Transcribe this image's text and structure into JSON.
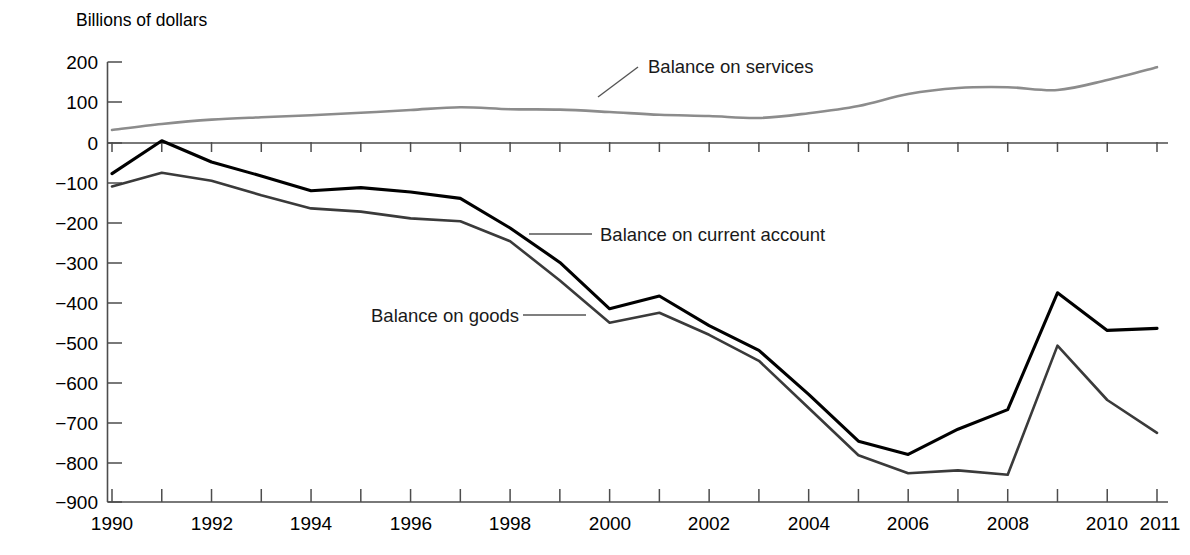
{
  "chart_data": {
    "type": "line",
    "title": "",
    "ylabel": "Billions of dollars",
    "xlabel": "",
    "ylim": [
      -900,
      200
    ],
    "xlim": [
      1990,
      2011
    ],
    "grid": false,
    "legend_position": "inline-annotations",
    "y_ticks": [
      200,
      100,
      0,
      -100,
      -200,
      -300,
      -400,
      -500,
      -600,
      -700,
      -800,
      -900
    ],
    "y_tick_labels": [
      "200",
      "100",
      "0",
      "−100",
      "−200",
      "−300",
      "−400",
      "−500",
      "−600",
      "−700",
      "−800",
      "−900"
    ],
    "x_ticks": [
      1990,
      1991,
      1992,
      1993,
      1994,
      1995,
      1996,
      1997,
      1998,
      1999,
      2000,
      2001,
      2002,
      2003,
      2004,
      2005,
      2006,
      2007,
      2008,
      2009,
      2010,
      2011
    ],
    "x_tick_labels_shown": [
      "1990",
      "1992",
      "1994",
      "1996",
      "1998",
      "2000",
      "2002",
      "2004",
      "2006",
      "2008",
      "2010",
      "2011"
    ],
    "x": [
      1990,
      1991,
      1992,
      1993,
      1994,
      1995,
      1996,
      1997,
      1998,
      1999,
      2000,
      2001,
      2002,
      2003,
      2004,
      2005,
      2006,
      2007,
      2008,
      2009,
      2010,
      2011
    ],
    "series": [
      {
        "name": "Balance on services",
        "color": "#8c8c8c",
        "values": [
          30,
          45,
          56,
          62,
          67,
          73,
          80,
          87,
          82,
          81,
          75,
          68,
          65,
          60,
          72,
          90,
          120,
          135,
          137,
          130,
          155,
          187
        ]
      },
      {
        "name": "Balance on current account",
        "color": "#000000",
        "values": [
          -79,
          3,
          -50,
          -85,
          -122,
          -114,
          -125,
          -141,
          -215,
          -301,
          -417,
          -385,
          -459,
          -521,
          -631,
          -748,
          -781,
          -718,
          -669,
          -377,
          -471,
          -466
        ]
      },
      {
        "name": "Balance on goods",
        "color": "#3a3a3a",
        "values": [
          -111,
          -77,
          -97,
          -133,
          -166,
          -174,
          -191,
          -198,
          -248,
          -346,
          -452,
          -427,
          -482,
          -547,
          -665,
          -783,
          -828,
          -821,
          -832,
          -509,
          -645,
          -727
        ]
      }
    ],
    "annotations": [
      {
        "label": "Balance on services",
        "target_year": 2001,
        "target_value": 68,
        "leader_style": "diagonal"
      },
      {
        "label": "Balance on current account",
        "target_year": 1999,
        "target_value": -301,
        "leader_style": "horizontal"
      },
      {
        "label": "Balance on goods",
        "target_year": 2000,
        "target_value": -452,
        "leader_style": "horizontal"
      }
    ]
  },
  "labels": {
    "y_axis_title": "Billions of dollars",
    "y": {
      "t200": "200",
      "t100": "100",
      "t0": "0",
      "tm100": "−100",
      "tm200": "−200",
      "tm300": "−300",
      "tm400": "−400",
      "tm500": "−500",
      "tm600": "−600",
      "tm700": "−700",
      "tm800": "−800",
      "tm900": "−900"
    },
    "x": {
      "y1990": "1990",
      "y1992": "1992",
      "y1994": "1994",
      "y1996": "1996",
      "y1998": "1998",
      "y2000": "2000",
      "y2002": "2002",
      "y2004": "2004",
      "y2006": "2006",
      "y2008": "2008",
      "y2010": "2010",
      "y2011": "2011"
    },
    "annotations": {
      "services": "Balance on services",
      "current_account": "Balance on current account",
      "goods": "Balance on goods"
    }
  },
  "colors": {
    "services": "#8c8c8c",
    "current_account": "#000000",
    "goods": "#3a3a3a",
    "axis": "#4d4d4d",
    "text": "#000000",
    "background": "#ffffff"
  }
}
